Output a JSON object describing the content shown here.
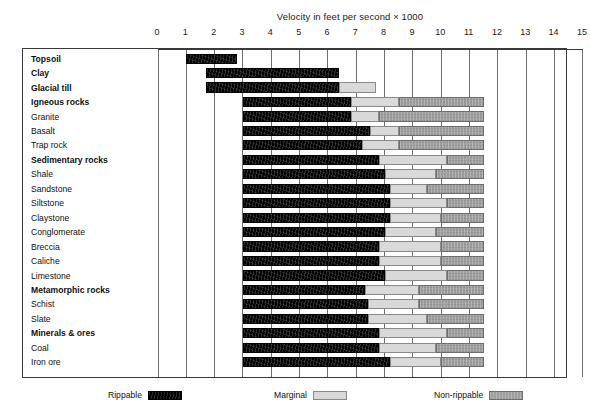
{
  "chart_data": {
    "type": "bar",
    "title": "Velocity in feet per second × 1000",
    "subtitle": "",
    "xlabel": "Velocity in feet per second × 1000",
    "ylabel": "",
    "xlim": [
      0,
      15
    ],
    "xticks": [
      0,
      1,
      2,
      3,
      4,
      5,
      6,
      7,
      8,
      9,
      10,
      11,
      12,
      13,
      14,
      15
    ],
    "xtick_labels": [
      "0",
      "1",
      "2",
      "3",
      "4",
      "5",
      "6",
      "7",
      "8",
      "9",
      "10",
      "11",
      "12",
      "13",
      "14",
      "15"
    ],
    "grid": true,
    "orientation": "horizontal",
    "stacked": true,
    "legend_position": "bottom",
    "series": [
      {
        "name": "Rippable",
        "color": "#000000"
      },
      {
        "name": "Marginal",
        "color": "#d9d9d9"
      },
      {
        "name": "Non-rippable",
        "color": "#9e9e9e"
      }
    ],
    "categories": [
      "Topsoil",
      "Clay",
      "Glacial till",
      "Igneous rocks",
      "Granite",
      "Basalt",
      "Trap rock",
      "Sedimentary rocks",
      "Shale",
      "Sandstone",
      "Siltstone",
      "Claystone",
      "Conglomerate",
      "Breccia",
      "Caliche",
      "Limestone",
      "Metamorphic rocks",
      "Schist",
      "Slate",
      "Minerals & ores",
      "Coal",
      "Iron ore"
    ],
    "rows": [
      {
        "label": "Topsoil",
        "group": true,
        "start": 1.0,
        "rippable_end": 2.8,
        "marginal_end": 2.8,
        "nonrippable_end": 2.8
      },
      {
        "label": "Clay",
        "group": true,
        "start": 1.7,
        "rippable_end": 6.4,
        "marginal_end": 6.4,
        "nonrippable_end": 6.4
      },
      {
        "label": "Glacial till",
        "group": true,
        "start": 1.7,
        "rippable_end": 6.4,
        "marginal_end": 7.7,
        "nonrippable_end": 7.7
      },
      {
        "label": "Igneous rocks",
        "group": true,
        "start": 3.0,
        "rippable_end": 6.8,
        "marginal_end": 8.5,
        "nonrippable_end": 11.5
      },
      {
        "label": "Granite",
        "group": false,
        "start": 3.0,
        "rippable_end": 6.8,
        "marginal_end": 7.8,
        "nonrippable_end": 11.5
      },
      {
        "label": "Basalt",
        "group": false,
        "start": 3.0,
        "rippable_end": 7.5,
        "marginal_end": 8.5,
        "nonrippable_end": 11.5
      },
      {
        "label": "Trap rock",
        "group": false,
        "start": 3.0,
        "rippable_end": 7.2,
        "marginal_end": 8.5,
        "nonrippable_end": 11.5
      },
      {
        "label": "Sedimentary rocks",
        "group": true,
        "start": 3.0,
        "rippable_end": 7.8,
        "marginal_end": 10.2,
        "nonrippable_end": 11.5
      },
      {
        "label": "Shale",
        "group": false,
        "start": 3.0,
        "rippable_end": 8.0,
        "marginal_end": 9.8,
        "nonrippable_end": 11.5
      },
      {
        "label": "Sandstone",
        "group": false,
        "start": 3.0,
        "rippable_end": 8.2,
        "marginal_end": 9.5,
        "nonrippable_end": 11.5
      },
      {
        "label": "Siltstone",
        "group": false,
        "start": 3.0,
        "rippable_end": 8.2,
        "marginal_end": 10.2,
        "nonrippable_end": 11.5
      },
      {
        "label": "Claystone",
        "group": false,
        "start": 3.0,
        "rippable_end": 8.2,
        "marginal_end": 10.0,
        "nonrippable_end": 11.5
      },
      {
        "label": "Conglomerate",
        "group": false,
        "start": 3.0,
        "rippable_end": 8.0,
        "marginal_end": 9.8,
        "nonrippable_end": 11.5
      },
      {
        "label": "Breccia",
        "group": false,
        "start": 3.0,
        "rippable_end": 7.8,
        "marginal_end": 10.0,
        "nonrippable_end": 11.5
      },
      {
        "label": "Caliche",
        "group": false,
        "start": 3.0,
        "rippable_end": 7.8,
        "marginal_end": 10.0,
        "nonrippable_end": 11.5
      },
      {
        "label": "Limestone",
        "group": false,
        "start": 3.0,
        "rippable_end": 8.0,
        "marginal_end": 10.2,
        "nonrippable_end": 11.5
      },
      {
        "label": "Metamorphic rocks",
        "group": true,
        "start": 3.0,
        "rippable_end": 7.3,
        "marginal_end": 9.2,
        "nonrippable_end": 11.5
      },
      {
        "label": "Schist",
        "group": false,
        "start": 3.0,
        "rippable_end": 7.4,
        "marginal_end": 9.2,
        "nonrippable_end": 11.5
      },
      {
        "label": "Slate",
        "group": false,
        "start": 3.0,
        "rippable_end": 7.4,
        "marginal_end": 9.5,
        "nonrippable_end": 11.5
      },
      {
        "label": "Minerals & ores",
        "group": true,
        "start": 3.0,
        "rippable_end": 7.8,
        "marginal_end": 10.2,
        "nonrippable_end": 11.5
      },
      {
        "label": "Coal",
        "group": false,
        "start": 3.0,
        "rippable_end": 7.8,
        "marginal_end": 9.8,
        "nonrippable_end": 11.5
      },
      {
        "label": "Iron ore",
        "group": false,
        "start": 3.0,
        "rippable_end": 8.2,
        "marginal_end": 10.0,
        "nonrippable_end": 11.5
      }
    ]
  },
  "legend": {
    "rippable": "Rippable",
    "marginal": "Marginal",
    "nonrippable": "Non-rippable"
  },
  "colors": {
    "rippable": "#000000",
    "marginal": "#d9d9d9",
    "nonrippable": "#9e9e9e",
    "frame": "#3a3a3a",
    "grid": "#6f6f6f"
  }
}
